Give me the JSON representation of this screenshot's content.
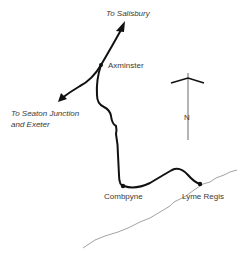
{
  "map": {
    "destinations": {
      "north": "To Salisbury",
      "west_line1": "To Seaton Junction",
      "west_line2": "and Exeter"
    },
    "stations": [
      {
        "name": "Axminster"
      },
      {
        "name": "Combpyne"
      },
      {
        "name": "Lyme Regis"
      }
    ],
    "compass": {
      "label": "N"
    },
    "colors": {
      "railway": "#111111",
      "coastline": "#8a8a8a",
      "text": "#3a3a3a"
    }
  }
}
